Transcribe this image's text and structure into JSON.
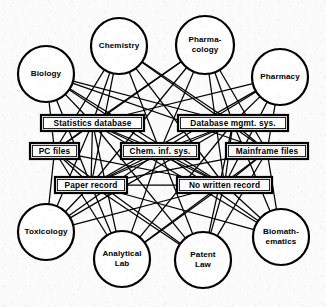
{
  "diagram": {
    "type": "network-graph",
    "width": 326,
    "height": 307,
    "background_color": "#fbfbfb",
    "line_color": "#000000",
    "node_fill_color": "#ffffff",
    "circle_nodes": [
      {
        "id": "biology",
        "label": "Biology",
        "lines": [
          "Biology"
        ],
        "cx": 46,
        "cy": 74,
        "r": 28
      },
      {
        "id": "chemistry",
        "label": "Chemistry",
        "lines": [
          "Chemistry"
        ],
        "cx": 119,
        "cy": 46,
        "r": 28
      },
      {
        "id": "pharmacology",
        "label": "Pharma-cology",
        "lines": [
          "Pharma-",
          "cology"
        ],
        "cx": 205,
        "cy": 45,
        "r": 29
      },
      {
        "id": "pharmacy",
        "label": "Pharmacy",
        "lines": [
          "Pharmacy"
        ],
        "cx": 280,
        "cy": 77,
        "r": 28
      },
      {
        "id": "toxicology",
        "label": "Toxicology",
        "lines": [
          "Toxicology"
        ],
        "cx": 46,
        "cy": 232,
        "r": 28
      },
      {
        "id": "analytical-lab",
        "label": "Analytical Lab",
        "lines": [
          "Analytical",
          "Lab"
        ],
        "cx": 122,
        "cy": 259,
        "r": 28
      },
      {
        "id": "patent-law",
        "label": "Patent Law",
        "lines": [
          "Patent",
          "Law"
        ],
        "cx": 203,
        "cy": 260,
        "r": 28
      },
      {
        "id": "biomathematics",
        "label": "Biomath-ematics",
        "lines": [
          "Biomath-",
          "ematics"
        ],
        "cx": 281,
        "cy": 237,
        "r": 28
      }
    ],
    "box_nodes": [
      {
        "id": "statistics-database",
        "label": "Statistics database",
        "x": 41,
        "y": 115,
        "w": 103,
        "h": 16
      },
      {
        "id": "database-mgmt-sys",
        "label": "Database mgmt. sys.",
        "x": 178,
        "y": 115,
        "w": 110,
        "h": 16
      },
      {
        "id": "pc-files",
        "label": "PC files",
        "x": 30,
        "y": 143,
        "w": 49,
        "h": 16
      },
      {
        "id": "chem-inf-sys",
        "label": "Chem. inf. sys.",
        "x": 121,
        "y": 143,
        "w": 78,
        "h": 16
      },
      {
        "id": "mainframe-files",
        "label": "Mainframe files",
        "x": 226,
        "y": 143,
        "w": 82,
        "h": 16
      },
      {
        "id": "paper-record",
        "label": "Paper record",
        "x": 55,
        "y": 177,
        "w": 72,
        "h": 16
      },
      {
        "id": "no-written-record",
        "label": "No written record",
        "x": 177,
        "y": 177,
        "w": 95,
        "h": 16
      }
    ],
    "edges": [
      [
        "biology",
        "statistics-database"
      ],
      [
        "biology",
        "database-mgmt-sys"
      ],
      [
        "biology",
        "pc-files"
      ],
      [
        "biology",
        "chem-inf-sys"
      ],
      [
        "biology",
        "mainframe-files"
      ],
      [
        "biology",
        "paper-record"
      ],
      [
        "biology",
        "no-written-record"
      ],
      [
        "chemistry",
        "statistics-database"
      ],
      [
        "chemistry",
        "database-mgmt-sys"
      ],
      [
        "chemistry",
        "pc-files"
      ],
      [
        "chemistry",
        "chem-inf-sys"
      ],
      [
        "chemistry",
        "mainframe-files"
      ],
      [
        "chemistry",
        "paper-record"
      ],
      [
        "chemistry",
        "no-written-record"
      ],
      [
        "pharmacology",
        "statistics-database"
      ],
      [
        "pharmacology",
        "database-mgmt-sys"
      ],
      [
        "pharmacology",
        "pc-files"
      ],
      [
        "pharmacology",
        "chem-inf-sys"
      ],
      [
        "pharmacology",
        "mainframe-files"
      ],
      [
        "pharmacology",
        "paper-record"
      ],
      [
        "pharmacology",
        "no-written-record"
      ],
      [
        "pharmacy",
        "statistics-database"
      ],
      [
        "pharmacy",
        "database-mgmt-sys"
      ],
      [
        "pharmacy",
        "chem-inf-sys"
      ],
      [
        "pharmacy",
        "mainframe-files"
      ],
      [
        "pharmacy",
        "paper-record"
      ],
      [
        "pharmacy",
        "no-written-record"
      ],
      [
        "toxicology",
        "statistics-database"
      ],
      [
        "toxicology",
        "pc-files"
      ],
      [
        "toxicology",
        "chem-inf-sys"
      ],
      [
        "toxicology",
        "paper-record"
      ],
      [
        "toxicology",
        "no-written-record"
      ],
      [
        "toxicology",
        "database-mgmt-sys"
      ],
      [
        "analytical-lab",
        "statistics-database"
      ],
      [
        "analytical-lab",
        "database-mgmt-sys"
      ],
      [
        "analytical-lab",
        "pc-files"
      ],
      [
        "analytical-lab",
        "chem-inf-sys"
      ],
      [
        "analytical-lab",
        "mainframe-files"
      ],
      [
        "analytical-lab",
        "paper-record"
      ],
      [
        "analytical-lab",
        "no-written-record"
      ],
      [
        "patent-law",
        "statistics-database"
      ],
      [
        "patent-law",
        "database-mgmt-sys"
      ],
      [
        "patent-law",
        "pc-files"
      ],
      [
        "patent-law",
        "chem-inf-sys"
      ],
      [
        "patent-law",
        "mainframe-files"
      ],
      [
        "patent-law",
        "paper-record"
      ],
      [
        "patent-law",
        "no-written-record"
      ],
      [
        "biomathematics",
        "statistics-database"
      ],
      [
        "biomathematics",
        "database-mgmt-sys"
      ],
      [
        "biomathematics",
        "chem-inf-sys"
      ],
      [
        "biomathematics",
        "mainframe-files"
      ],
      [
        "biomathematics",
        "paper-record"
      ],
      [
        "biomathematics",
        "no-written-record"
      ],
      [
        "statistics-database",
        "pc-files"
      ],
      [
        "statistics-database",
        "chem-inf-sys"
      ],
      [
        "statistics-database",
        "paper-record"
      ],
      [
        "statistics-database",
        "no-written-record"
      ],
      [
        "database-mgmt-sys",
        "mainframe-files"
      ],
      [
        "database-mgmt-sys",
        "chem-inf-sys"
      ],
      [
        "database-mgmt-sys",
        "no-written-record"
      ],
      [
        "database-mgmt-sys",
        "paper-record"
      ],
      [
        "pc-files",
        "paper-record"
      ],
      [
        "pc-files",
        "no-written-record"
      ],
      [
        "chem-inf-sys",
        "paper-record"
      ],
      [
        "chem-inf-sys",
        "no-written-record"
      ],
      [
        "mainframe-files",
        "no-written-record"
      ],
      [
        "mainframe-files",
        "paper-record"
      ],
      [
        "paper-record",
        "no-written-record"
      ]
    ]
  }
}
